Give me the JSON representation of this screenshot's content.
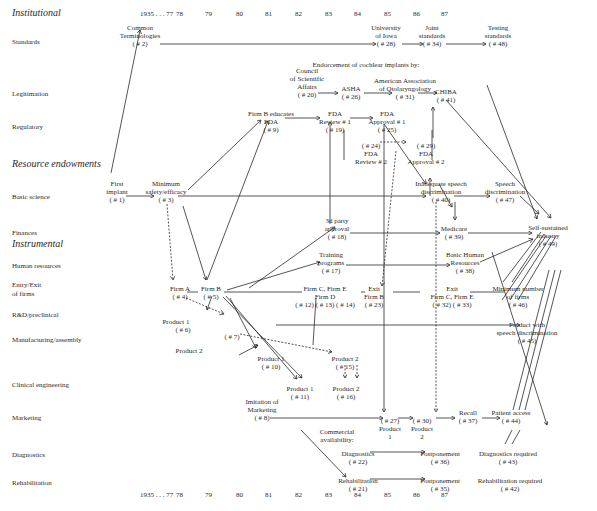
{
  "sections": [
    {
      "label": "Institutional",
      "x": 12,
      "y": 15
    },
    {
      "label": "Resource endowments",
      "x": 12,
      "y": 166
    },
    {
      "label": "Instrumental",
      "x": 12,
      "y": 246
    }
  ],
  "row_labels": [
    {
      "label": "Standards",
      "y": 42
    },
    {
      "label": "Legitimation",
      "y": 94
    },
    {
      "label": "Regulatory",
      "y": 127
    },
    {
      "label": "Basic science",
      "y": 197
    },
    {
      "label": "Finances",
      "y": 233
    },
    {
      "label": "Human resources",
      "y": 266
    },
    {
      "label": "Entry/Exit",
      "y": 285
    },
    {
      "label": "of firms",
      "y": 294
    },
    {
      "label": "R&D/preclinical",
      "y": 315
    },
    {
      "label": "Manufacturing/assembly",
      "y": 340
    },
    {
      "label": "Clinical engineering",
      "y": 385
    },
    {
      "label": "Marketing",
      "y": 418
    },
    {
      "label": "Diagnostics",
      "y": 455
    },
    {
      "label": "Rehabilitation",
      "y": 483
    }
  ],
  "years": [
    {
      "label": "1935 . . . 77",
      "x": 148
    },
    {
      "label": "78",
      "x": 184
    },
    {
      "label": "79",
      "x": 213
    },
    {
      "label": "80",
      "x": 244
    },
    {
      "label": "81",
      "x": 273
    },
    {
      "label": "82",
      "x": 303
    },
    {
      "label": "83",
      "x": 333
    },
    {
      "label": "84",
      "x": 362
    },
    {
      "label": "85",
      "x": 392
    },
    {
      "label": "86",
      "x": 421
    },
    {
      "label": "87",
      "x": 449
    }
  ],
  "year_rows": {
    "top_y": 15,
    "bottom_y": 496
  },
  "nodes": [
    {
      "id": "n2",
      "text": "Common\nTerminologies\n( # 2)",
      "x": 140,
      "y": 24
    },
    {
      "id": "n28",
      "text": "University\nof Iowa\n( # 28)",
      "x": 386,
      "y": 24
    },
    {
      "id": "n34",
      "text": "Joint\nstandards\n( # 34)",
      "x": 432,
      "y": 24
    },
    {
      "id": "n48",
      "text": "Testing\nstandards\n( # 48)",
      "x": 498,
      "y": 24
    },
    {
      "id": "endorse",
      "text": "Endorcement of cochlear implants by:",
      "x": 366,
      "y": 61
    },
    {
      "id": "n20",
      "text": "Council\nof Scientific\nAffairs\n( # 20)",
      "x": 307,
      "y": 67
    },
    {
      "id": "n26",
      "text": "ASHA\n( # 26)",
      "x": 351,
      "y": 85
    },
    {
      "id": "n31",
      "text": "American Association\nof Otolaryngology\n( # 31)",
      "x": 405,
      "y": 77
    },
    {
      "id": "n41",
      "text": "CHIBA\n( # 41)",
      "x": 446,
      "y": 88
    },
    {
      "id": "n9",
      "text": "Firm B educates\nFDA\n( # 9)",
      "x": 271,
      "y": 110
    },
    {
      "id": "n19",
      "text": "FDA\nReview # 1\n( # 19)",
      "x": 335,
      "y": 110
    },
    {
      "id": "n25",
      "text": "FDA\nApproval # 1\n( # 25)",
      "x": 387,
      "y": 110
    },
    {
      "id": "n24",
      "text": "( # 24)\nFDA\nReview # 2",
      "x": 371,
      "y": 142
    },
    {
      "id": "n29",
      "text": "( # 29)\nFDA\nApproval # 2",
      "x": 426,
      "y": 142
    },
    {
      "id": "n1",
      "text": "First\nimplant\n( # 1)",
      "x": 117,
      "y": 180
    },
    {
      "id": "n3",
      "text": "Minimum\nsafety/efficacy\n( # 3)",
      "x": 166,
      "y": 180
    },
    {
      "id": "n40",
      "text": "Inadequate speech\ndiscrimination\n( # 40)",
      "x": 441,
      "y": 180
    },
    {
      "id": "n47",
      "text": "Speech\ndiscrimination\n( # 47)",
      "x": 505,
      "y": 180
    },
    {
      "id": "n49",
      "text": "Self-sustained\nindustry\n( # 49)",
      "x": 548,
      "y": 224
    },
    {
      "id": "n18",
      "text": "3d party\napproval\n( # 18)",
      "x": 337,
      "y": 217
    },
    {
      "id": "n39",
      "text": "Medicare\n( # 39)",
      "x": 454,
      "y": 225
    },
    {
      "id": "n17",
      "text": "Training\nprograms\n( # 17)",
      "x": 331,
      "y": 251
    },
    {
      "id": "n38",
      "text": "Basic Human\nResources\n( # 38)",
      "x": 465,
      "y": 251
    },
    {
      "id": "n4",
      "text": "Firm A\n( # 4)",
      "x": 180,
      "y": 285
    },
    {
      "id": "n5",
      "text": "Firm B\n( # 5)",
      "x": 211,
      "y": 285
    },
    {
      "id": "n12",
      "text": "Firm C, Firm E\nFirm D\n( # 12) ( # 13) ( # 14)",
      "x": 325,
      "y": 285
    },
    {
      "id": "n23",
      "text": "Exit\nFirm B\n( # 23)",
      "x": 374,
      "y": 285
    },
    {
      "id": "n32",
      "text": "Exit\nFirm C, Firm E\n( # 32) ( # 33)",
      "x": 452,
      "y": 285
    },
    {
      "id": "n46",
      "text": "Minimum number\nof firms\n( # 46)",
      "x": 518,
      "y": 285
    },
    {
      "id": "n6",
      "text": "Product 1\n        ( # 6)",
      "x": 176,
      "y": 318
    },
    {
      "id": "n7",
      "text": "( # 7)",
      "x": 232,
      "y": 333
    },
    {
      "id": "p2",
      "text": "Product 2",
      "x": 189,
      "y": 347
    },
    {
      "id": "n45",
      "text": "Product with\nspeech discrimination\n( # 45)",
      "x": 527,
      "y": 321
    },
    {
      "id": "n10",
      "text": "Product 1\n( # 10)",
      "x": 271,
      "y": 355
    },
    {
      "id": "n15",
      "text": "Product 2\n( # 15)",
      "x": 345,
      "y": 355
    },
    {
      "id": "n11",
      "text": "Product 1\n( # 11)",
      "x": 300,
      "y": 385
    },
    {
      "id": "n16",
      "text": "Product 2\n( # 16)",
      "x": 346,
      "y": 385
    },
    {
      "id": "n8",
      "text": "Imitation of\nMarketing\n( # 8)",
      "x": 262,
      "y": 398
    },
    {
      "id": "n27",
      "text": "( # 27)\nProduct\n1",
      "x": 390,
      "y": 417
    },
    {
      "id": "n30",
      "text": "( # 30)\nProduct\n2",
      "x": 422,
      "y": 417
    },
    {
      "id": "n37",
      "text": "Recall\n( # 37)",
      "x": 468,
      "y": 409
    },
    {
      "id": "n44",
      "text": "Patient access\n( # 44)",
      "x": 511,
      "y": 409
    },
    {
      "id": "ca",
      "text": "Commercial\navailability:",
      "x": 337,
      "y": 428
    },
    {
      "id": "n22",
      "text": "Diagnostics\n( # 22)",
      "x": 358,
      "y": 450
    },
    {
      "id": "n36",
      "text": "Postponement\n( # 36)",
      "x": 440,
      "y": 450
    },
    {
      "id": "n43",
      "text": "Diagnostics required\n( # 43)",
      "x": 508,
      "y": 450
    },
    {
      "id": "n21",
      "text": "Rehabilitation\n( # 21)",
      "x": 358,
      "y": 477
    },
    {
      "id": "n35",
      "text": "Postponement\n( # 35)",
      "x": 440,
      "y": 477
    },
    {
      "id": "n42",
      "text": "Rehabilitation required\n( # 42)",
      "x": 510,
      "y": 477
    }
  ],
  "edges": {
    "solid_arrows": [
      [
        160,
        44,
        376,
        44
      ],
      [
        402,
        44,
        423,
        44
      ],
      [
        446,
        44,
        486,
        44
      ],
      [
        318,
        93,
        338,
        93
      ],
      [
        364,
        93,
        392,
        93
      ],
      [
        418,
        93,
        437,
        93
      ],
      [
        285,
        118,
        320,
        118
      ],
      [
        350,
        118,
        373,
        118
      ],
      [
        126,
        196,
        154,
        196
      ],
      [
        178,
        196,
        426,
        196
      ],
      [
        454,
        196,
        490,
        196
      ],
      [
        350,
        233,
        440,
        233
      ],
      [
        468,
        233,
        532,
        233
      ],
      [
        346,
        265,
        450,
        265
      ],
      [
        111,
        173,
        140,
        30
      ],
      [
        188,
        190,
        261,
        120
      ],
      [
        207,
        280,
        268,
        121
      ],
      [
        183,
        206,
        206,
        280
      ],
      [
        249,
        288,
        335,
        227
      ],
      [
        227,
        290,
        320,
        262
      ],
      [
        330,
        224,
        330,
        122
      ],
      [
        239,
        355,
        258,
        345
      ],
      [
        270,
        418,
        383,
        418
      ],
      [
        398,
        418,
        413,
        418
      ],
      [
        436,
        418,
        455,
        418
      ],
      [
        482,
        418,
        500,
        418
      ],
      [
        370,
        452,
        425,
        452
      ],
      [
        370,
        479,
        425,
        479
      ],
      [
        212,
        296,
        207,
        310
      ],
      [
        226,
        296,
        297,
        379
      ],
      [
        223,
        297,
        302,
        378
      ],
      [
        487,
        85,
        537,
        219
      ],
      [
        446,
        100,
        551,
        218
      ],
      [
        439,
        184,
        452,
        207
      ],
      [
        455,
        202,
        455,
        220
      ],
      [
        384,
        124,
        426,
        184
      ],
      [
        430,
        196,
        430,
        178
      ],
      [
        433,
        138,
        433,
        107
      ],
      [
        520,
        196,
        539,
        214
      ],
      [
        480,
        262,
        533,
        239
      ],
      [
        276,
        325,
        520,
        325
      ],
      [
        301,
        430,
        346,
        477
      ],
      [
        230,
        298,
        256,
        348
      ],
      [
        384,
        124,
        384,
        412
      ],
      [
        492,
        252,
        547,
        425
      ]
    ],
    "plain_lines": [
      [
        187,
        292,
        198,
        292
      ],
      [
        224,
        292,
        302,
        292
      ],
      [
        361,
        292,
        365,
        292
      ],
      [
        393,
        292,
        420,
        292
      ],
      [
        470,
        292,
        504,
        292
      ],
      [
        316,
        298,
        313,
        345
      ],
      [
        505,
        444,
        512,
        430
      ],
      [
        512,
        444,
        520,
        430
      ],
      [
        513,
        410,
        549,
        270
      ],
      [
        519,
        410,
        555,
        270
      ],
      [
        525,
        410,
        561,
        270
      ],
      [
        503,
        282,
        541,
        232
      ],
      [
        512,
        282,
        544,
        234
      ],
      [
        502,
        300,
        546,
        236
      ],
      [
        510,
        300,
        551,
        236
      ],
      [
        518,
        300,
        556,
        236
      ],
      [
        344,
        130,
        344,
        160
      ],
      [
        432,
        130,
        432,
        160
      ]
    ],
    "dashed_arrows": [
      [
        167,
        204,
        173,
        280
      ],
      [
        186,
        298,
        224,
        314
      ],
      [
        240,
        334,
        332,
        352
      ],
      [
        396,
        151,
        382,
        286
      ],
      [
        380,
        142,
        406,
        142
      ],
      [
        436,
        202,
        436,
        412
      ],
      [
        345,
        365,
        345,
        378
      ],
      [
        357,
        365,
        357,
        378
      ]
    ]
  },
  "colors": {
    "ink": "#2a2a2a",
    "background": "#ffffff"
  }
}
